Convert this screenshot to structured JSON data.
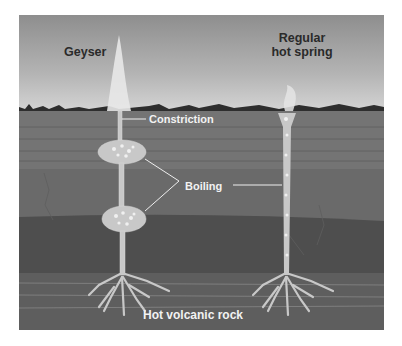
{
  "diagram": {
    "labels": {
      "geyser": "Geyser",
      "hot_spring_line1": "Regular",
      "hot_spring_line2": "hot spring",
      "constriction": "Constriction",
      "boiling": "Boiling",
      "rock": "Hot volcanic rock"
    },
    "colors": {
      "sky_top": "#8e8e8e",
      "sky_bottom": "#d6d6d6",
      "layer1": "#747474",
      "layer2": "#666666",
      "layer3": "#505050",
      "layer4": "#5c5c5c",
      "water": "#c8c8c8",
      "label_dark": "#2a2a2a",
      "label_light": "#f2f2f2"
    }
  }
}
